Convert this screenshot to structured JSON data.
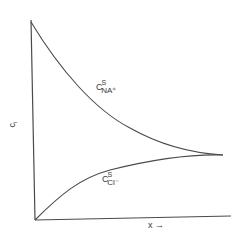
{
  "diagram": {
    "y_axis_label": "c",
    "y_axis_label_sub": "i",
    "x_axis_label": "x →",
    "curves": [
      {
        "name": "sodium-surface-concentration",
        "label_main": "C",
        "label_sup": "S",
        "label_sub": "NA⁺",
        "shape": "decreasing from high at x=0 to converge point"
      },
      {
        "name": "chloride-surface-concentration",
        "label_main": "C",
        "label_sup": "S",
        "label_sub": "Cl⁻",
        "shape": "increasing from 0 at x=0 to converge point"
      }
    ],
    "colors": {
      "line": "#4a4a4a",
      "background": "#ffffff"
    }
  }
}
